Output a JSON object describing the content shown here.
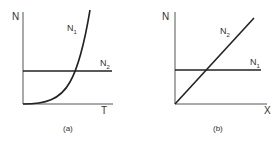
{
  "panels": [
    {
      "id": "a",
      "caption": "(a)",
      "y_axis_label": "N",
      "x_axis_label": "T",
      "curve_label": "N",
      "curve_label_sub": "1",
      "line_label": "N",
      "line_label_sub": "2"
    },
    {
      "id": "b",
      "caption": "(b)",
      "y_axis_label": "N",
      "x_axis_label": "X",
      "curve_label": "N",
      "curve_label_sub": "2",
      "line_label": "N",
      "line_label_sub": "1"
    }
  ],
  "colors": {
    "line": "#222222",
    "axis": "#555555",
    "background": "#ffffff"
  }
}
